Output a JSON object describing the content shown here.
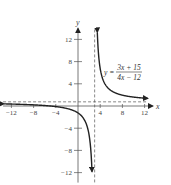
{
  "chart_data": {
    "type": "line",
    "title": "",
    "function": "y = (3x + 15)/(4x - 12)",
    "equation_label": {
      "lhs": "y =",
      "numerator": "3x + 15",
      "denominator": "4x − 12"
    },
    "xlabel": "x",
    "ylabel": "y",
    "xlim": [
      -13,
      13.5
    ],
    "ylim": [
      -13,
      14
    ],
    "x_ticks": [
      -12,
      -8,
      -4,
      4,
      8,
      12
    ],
    "y_ticks": [
      -12,
      -8,
      -4,
      4,
      8,
      12
    ],
    "x_tick_labels": [
      "−12",
      "−8",
      "−4",
      "4",
      "8",
      "12"
    ],
    "y_tick_labels": [
      "−12",
      "−8",
      "−4",
      "4",
      "8",
      "12"
    ],
    "asymptotes": {
      "vertical": 3,
      "horizontal": 0.75
    },
    "grid": false,
    "series": [
      {
        "name": "left branch",
        "x": [
          -12,
          -8,
          -4,
          -2,
          0,
          1,
          2,
          2.5
        ],
        "y": [
          -0.35,
          0.2,
          0.125,
          -0.45,
          -1.25,
          -2.25,
          -5.25,
          -11.25
        ]
      },
      {
        "name": "right branch",
        "x": [
          3.25,
          3.5,
          4,
          5,
          6,
          8,
          10,
          12
        ],
        "y": [
          24.75,
          12.75,
          6.75,
          3.75,
          2.75,
          1.95,
          1.61,
          1.42
        ]
      }
    ]
  }
}
